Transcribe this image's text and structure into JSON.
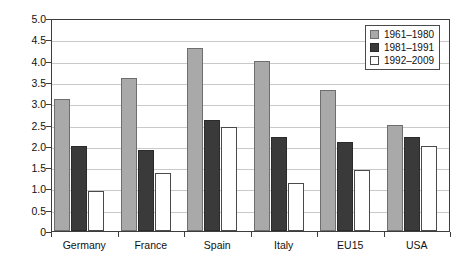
{
  "chart_data": {
    "type": "bar",
    "title": "",
    "xlabel": "",
    "ylabel": "Growth of GDP per captia",
    "ylim": [
      0,
      5.0
    ],
    "ytick_step": 0.5,
    "yticks": [
      "0",
      "0.5",
      "1.0",
      "1.5",
      "2.0",
      "2.5",
      "3.0",
      "3.5",
      "4.0",
      "4.5",
      "5.0"
    ],
    "grid": true,
    "legend_position": "top-right",
    "categories": [
      "Germany",
      "France",
      "Spain",
      "Italy",
      "EU15",
      "USA"
    ],
    "series": [
      {
        "name": "1961–1980",
        "color": "#a9a9a9",
        "values": [
          3.1,
          3.6,
          4.3,
          4.0,
          3.3,
          2.5
        ]
      },
      {
        "name": "1981–1991",
        "color": "#3a3a3a",
        "values": [
          2.0,
          1.9,
          2.6,
          2.2,
          2.1,
          2.2
        ]
      },
      {
        "name": "1992–2009",
        "color": "#ffffff",
        "values": [
          0.95,
          1.37,
          2.45,
          1.12,
          1.43,
          2.0
        ]
      }
    ]
  }
}
